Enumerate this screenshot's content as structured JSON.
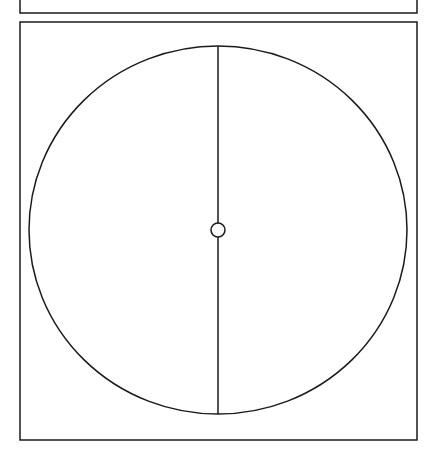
{
  "diagram": {
    "colors": {
      "stroke": "#1a1a1a",
      "background": "#ffffff"
    },
    "top_frame": {
      "x": 20,
      "y": -5,
      "width": 397,
      "height": 18
    },
    "main_frame": {
      "x": 20,
      "y": 22,
      "width": 397,
      "height": 418
    },
    "circle": {
      "cx": 218,
      "cy": 230,
      "rx": 189,
      "ry": 184
    },
    "diameter": {
      "x": 218,
      "y1": 46,
      "y2": 414
    },
    "hub": {
      "cx": 218,
      "cy": 230,
      "r": 7
    }
  }
}
